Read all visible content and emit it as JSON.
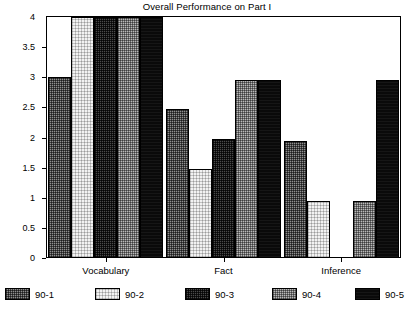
{
  "chart_data": {
    "type": "bar",
    "title": "Overall Performance on Part I",
    "xlabel": "",
    "ylabel": "",
    "ylim": [
      0,
      4
    ],
    "ytick_labels": [
      "0",
      "0.5",
      "1",
      "1.5",
      "2",
      "2.5",
      "3",
      "3.5",
      "4"
    ],
    "ytick_values": [
      0,
      0.5,
      1,
      1.5,
      2,
      2.5,
      3,
      3.5,
      4
    ],
    "grid": false,
    "legend_position": "bottom",
    "categories": [
      "Vocabulary",
      "Fact",
      "Inference"
    ],
    "series": [
      {
        "name": "90-1",
        "values": [
          3.0,
          2.47,
          1.95
        ]
      },
      {
        "name": "90-2",
        "values": [
          4.0,
          1.47,
          0.95
        ]
      },
      {
        "name": "90-3",
        "values": [
          4.0,
          1.97,
          0.0
        ]
      },
      {
        "name": "90-4",
        "values": [
          4.0,
          2.95,
          0.95
        ]
      },
      {
        "name": "90-5",
        "values": [
          4.0,
          2.95,
          2.95
        ]
      }
    ]
  },
  "legend": {
    "items": [
      {
        "label": "90-1",
        "swatch": "series-1-swatch"
      },
      {
        "label": "90-2",
        "swatch": "series-2-swatch"
      },
      {
        "label": "90-3",
        "swatch": "series-3-swatch"
      },
      {
        "label": "90-4",
        "swatch": "series-4-swatch"
      },
      {
        "label": "90-5",
        "swatch": "series-5-swatch"
      }
    ]
  }
}
